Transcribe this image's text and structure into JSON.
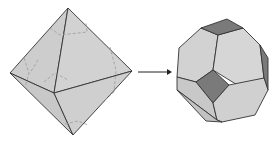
{
  "diagram": {
    "left_shape": "octahedron",
    "right_shape": "truncated-octahedron",
    "arrow": "right-arrow",
    "colors": {
      "face_light": "#d0d0d0",
      "face_mid": "#c4c4c4",
      "face_dark": "#7a7a7a",
      "edge": "#333333",
      "hidden_edge": "#999999"
    }
  }
}
